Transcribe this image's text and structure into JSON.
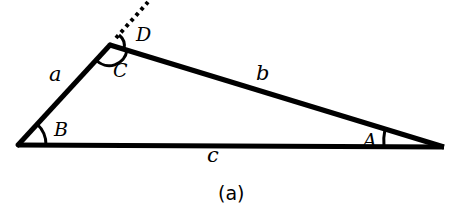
{
  "figure": {
    "caption": "(a)",
    "vertices": {
      "left": {
        "x": 18,
        "y": 145
      },
      "top": {
        "x": 110,
        "y": 45
      },
      "right": {
        "x": 444,
        "y": 147
      }
    },
    "sides": {
      "a": {
        "label": "a",
        "x": 49,
        "y": 81
      },
      "b": {
        "label": "b",
        "x": 258,
        "y": 78
      },
      "c": {
        "label": "c",
        "x": 212,
        "y": 161
      }
    },
    "angles": {
      "A": {
        "label": "A",
        "x": 367,
        "y": 145
      },
      "B": {
        "label": "B",
        "x": 53,
        "y": 134
      },
      "C": {
        "label": "C",
        "x": 119,
        "y": 75
      },
      "D": {
        "label": "D",
        "x": 136,
        "y": 42
      }
    },
    "extension": {
      "style": "dotted",
      "from": {
        "x": 110,
        "y": 45
      },
      "to": {
        "x": 148,
        "y": 0
      }
    },
    "colors": {
      "stroke": "#000000",
      "background": "#ffffff"
    }
  }
}
